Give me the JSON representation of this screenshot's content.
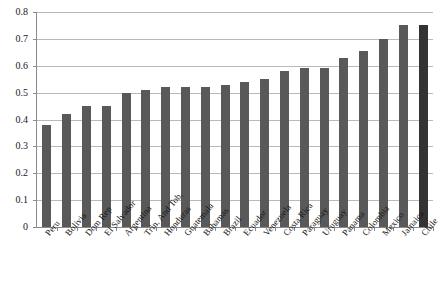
{
  "chart_data": {
    "type": "bar",
    "title": "",
    "subtitle": "",
    "xlabel": "",
    "ylabel": "",
    "ylim": [
      0,
      0.8
    ],
    "ytick_labels": [
      "0",
      "0.1",
      "0.2",
      "0.3",
      "0.4",
      "0.5",
      "0.6",
      "0.7",
      "0.8"
    ],
    "ytick_values": [
      0,
      0.1,
      0.2,
      0.3,
      0.4,
      0.5,
      0.6,
      0.7,
      0.8
    ],
    "grid": true,
    "legend": "none",
    "legend_position": "none",
    "bar_color": "#595959",
    "highlight_color": "#333333",
    "highlight_category": "Chile",
    "categories": [
      "Peru",
      "Bolivia",
      "Dom Rep",
      "El Salvador",
      "Argentina",
      "Trin. And Tob.",
      "Honduras",
      "Guatemala",
      "Bahamas",
      "Brazil",
      "Ecuador",
      "Venezuela",
      "Costa Rica",
      "Paraguay",
      "Uruguay",
      "Panama",
      "Colombia",
      "Mexico",
      "Jamaica",
      "Chile"
    ],
    "values": [
      0.38,
      0.42,
      0.45,
      0.45,
      0.5,
      0.51,
      0.52,
      0.52,
      0.52,
      0.53,
      0.54,
      0.55,
      0.58,
      0.59,
      0.59,
      0.63,
      0.655,
      0.7,
      0.75,
      0.75
    ]
  }
}
